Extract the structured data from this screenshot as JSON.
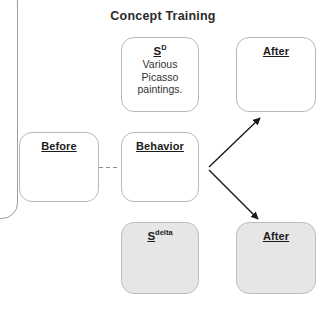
{
  "diagram": {
    "title": "Concept Training",
    "nodes": {
      "s_zero": {
        "symbol_base": "S",
        "symbol_sup": "D",
        "line1": "Various",
        "line2": "Picasso",
        "line3": "paintings."
      },
      "after_top": {
        "label": "After"
      },
      "before": {
        "label": "Before"
      },
      "behavior": {
        "label": "Behavior"
      },
      "s_delta": {
        "symbol_base": "S",
        "symbol_sup": "delta"
      },
      "after_bottom": {
        "label": "After"
      }
    },
    "colors": {
      "shaded_fill": "#e6e6e6",
      "plain_fill": "#ffffff",
      "border": "#b9b9b9",
      "text": "#1c1c1c",
      "title_text": "#2b2b2b",
      "arrow": "#1a1a1a",
      "dashed_link": "#9a9a9a"
    }
  }
}
